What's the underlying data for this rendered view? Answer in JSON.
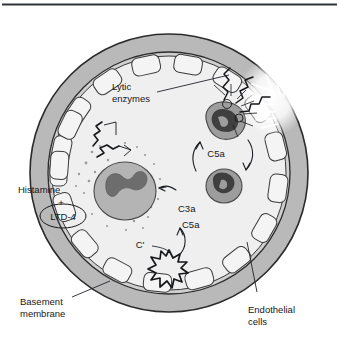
{
  "figure": {
    "type": "biomedical-illustration",
    "top_rule": true,
    "labels": {
      "lytic_enzymes": "Lytic\nenzymes",
      "lytic_enzymes_line1": "Lytic",
      "lytic_enzymes_line2": "enzymes",
      "histamine": "Histamine",
      "plus": "+",
      "ltd4": "LTD-4",
      "c3a": "C3a",
      "c5a_center": "C5a",
      "c5a_upper": "C5a",
      "c_prime": "C'",
      "basement_line1": "Basement",
      "basement_line2": "membrane",
      "endothelial_line1": "Endothelial",
      "endothelial_line2": "cells"
    },
    "colors": {
      "background": "#ffffff",
      "outer_ring": "#b9b9b9",
      "outer_ring_stroke": "#2b2b2b",
      "lumen": "#efefef",
      "endothelial_cell_fill": "#f4f4f4",
      "endothelial_cell_stroke": "#3a3a3a",
      "mast_cell_cytoplasm": "#b4b4b4",
      "mast_cell_nucleus": "#6d6d6d",
      "neutrophil_cytoplasm": "#9d9d9d",
      "neutrophil_nucleus": "#3f3f3f",
      "granule_dot": "#9a9a9a",
      "text": "#15171a",
      "top_rule": "#2f3337",
      "highlight_burst": "#ffffff"
    },
    "elements": {
      "outer_ring_label": "vessel wall outer ring",
      "lumen_label": "vessel lumen",
      "endothelial_ring_label": "ring of endothelial cells",
      "mast_cell_label": "degranulating mast cell",
      "neutrophil_upper_label": "neutrophil releasing lytic enzymes",
      "neutrophil_lower_label": "migrating neutrophil",
      "complement_complex_label": "complement activation complex",
      "mediator_squiggles_label": "chemical mediator squiggles",
      "granules_label": "released granules",
      "damage_burst_label": "endothelial damage burst"
    }
  }
}
